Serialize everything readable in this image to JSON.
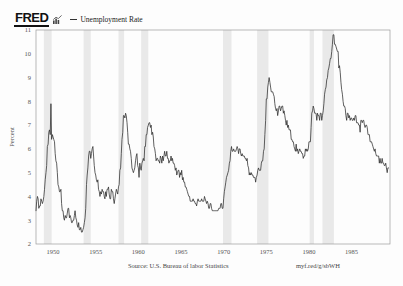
{
  "header": {
    "logo_text": "FRED",
    "logo_icon": "fred-bar-chart-icon",
    "legend_dash": "legend-line-dash",
    "series_label": "Unemployment Rate"
  },
  "footer": {
    "source": "Source: U.S. Bureau of labor Statistics",
    "url": "myf.red/g/sbWH"
  },
  "colors": {
    "line": "#2b2b2b",
    "recession_band": "#e9e9e9",
    "frame": "#9a9a9a",
    "text": "#555555",
    "background": "#fdfdfd"
  },
  "chart_data": {
    "type": "line",
    "title": "",
    "xlabel": "",
    "ylabel": "Percent",
    "ylim": [
      2,
      11
    ],
    "xlim": [
      1948.0,
      1989.5
    ],
    "yticks": [
      11,
      10,
      9,
      8,
      7,
      6,
      5,
      4,
      3,
      2
    ],
    "ytick_labels": [
      "11",
      "10",
      "9",
      "8",
      "7",
      "6",
      "5",
      "4",
      "3",
      "2"
    ],
    "xticks": [
      1950,
      1955,
      1960,
      1965,
      1970,
      1975,
      1980,
      1985
    ],
    "xtick_labels": [
      "1950",
      "1955",
      "1960",
      "1965",
      "1970",
      "1975",
      "1980",
      "1985"
    ],
    "grid": false,
    "legend_position": "top-left",
    "recession_bands": [
      [
        1948.92,
        1949.83
      ],
      [
        1953.58,
        1954.42
      ],
      [
        1957.67,
        1958.33
      ],
      [
        1960.33,
        1961.17
      ],
      [
        1969.92,
        1970.92
      ],
      [
        1973.92,
        1975.25
      ],
      [
        1980.08,
        1980.58
      ],
      [
        1981.58,
        1982.92
      ]
    ],
    "series": [
      {
        "name": "Unemployment Rate",
        "x": [
          1948.0,
          1948.08,
          1948.17,
          1948.25,
          1948.33,
          1948.42,
          1948.5,
          1948.58,
          1948.67,
          1948.75,
          1948.83,
          1948.92,
          1949.0,
          1949.08,
          1949.17,
          1949.25,
          1949.33,
          1949.42,
          1949.5,
          1949.58,
          1949.67,
          1949.75,
          1949.83,
          1949.92,
          1950.0,
          1950.08,
          1950.17,
          1950.25,
          1950.33,
          1950.42,
          1950.5,
          1950.58,
          1950.67,
          1950.75,
          1950.83,
          1950.92,
          1951.0,
          1951.08,
          1951.17,
          1951.25,
          1951.33,
          1951.42,
          1951.5,
          1951.58,
          1951.67,
          1951.75,
          1951.83,
          1951.92,
          1952.0,
          1952.08,
          1952.17,
          1952.25,
          1952.33,
          1952.42,
          1952.5,
          1952.58,
          1952.67,
          1952.75,
          1952.83,
          1952.92,
          1953.0,
          1953.08,
          1953.17,
          1953.25,
          1953.33,
          1953.42,
          1953.5,
          1953.58,
          1953.67,
          1953.75,
          1953.83,
          1953.92,
          1954.0,
          1954.08,
          1954.17,
          1954.25,
          1954.33,
          1954.42,
          1954.5,
          1954.58,
          1954.67,
          1954.75,
          1954.83,
          1954.92,
          1955.0,
          1955.08,
          1955.17,
          1955.25,
          1955.33,
          1955.42,
          1955.5,
          1955.58,
          1955.67,
          1955.75,
          1955.83,
          1955.92,
          1956.0,
          1956.08,
          1956.17,
          1956.25,
          1956.33,
          1956.42,
          1956.5,
          1956.58,
          1956.67,
          1956.75,
          1956.83,
          1956.92,
          1957.0,
          1957.08,
          1957.17,
          1957.25,
          1957.33,
          1957.42,
          1957.5,
          1957.58,
          1957.67,
          1957.75,
          1957.83,
          1957.92,
          1958.0,
          1958.08,
          1958.17,
          1958.25,
          1958.33,
          1958.42,
          1958.5,
          1958.58,
          1958.67,
          1958.75,
          1958.83,
          1958.92,
          1959.0,
          1959.08,
          1959.17,
          1959.25,
          1959.33,
          1959.42,
          1959.5,
          1959.58,
          1959.67,
          1959.75,
          1959.83,
          1959.92,
          1960.0,
          1960.08,
          1960.17,
          1960.25,
          1960.33,
          1960.42,
          1960.5,
          1960.58,
          1960.67,
          1960.75,
          1960.83,
          1960.92,
          1961.0,
          1961.08,
          1961.17,
          1961.25,
          1961.33,
          1961.42,
          1961.5,
          1961.58,
          1961.67,
          1961.75,
          1961.83,
          1961.92,
          1962.0,
          1962.08,
          1962.17,
          1962.25,
          1962.33,
          1962.42,
          1962.5,
          1962.58,
          1962.67,
          1962.75,
          1962.83,
          1962.92,
          1963.0,
          1963.08,
          1963.17,
          1963.25,
          1963.33,
          1963.42,
          1963.5,
          1963.58,
          1963.67,
          1963.75,
          1963.83,
          1963.92,
          1964.0,
          1964.08,
          1964.17,
          1964.25,
          1964.33,
          1964.42,
          1964.5,
          1964.58,
          1964.67,
          1964.75,
          1964.83,
          1964.92,
          1965.0,
          1965.08,
          1965.17,
          1965.25,
          1965.33,
          1965.42,
          1965.5,
          1965.58,
          1965.67,
          1965.75,
          1965.83,
          1965.92,
          1966.0,
          1966.08,
          1966.17,
          1966.25,
          1966.33,
          1966.42,
          1966.5,
          1966.58,
          1966.67,
          1966.75,
          1966.83,
          1966.92,
          1967.0,
          1967.08,
          1967.17,
          1967.25,
          1967.33,
          1967.42,
          1967.5,
          1967.58,
          1967.67,
          1967.75,
          1967.83,
          1967.92,
          1968.0,
          1968.08,
          1968.17,
          1968.25,
          1968.33,
          1968.42,
          1968.5,
          1968.58,
          1968.67,
          1968.75,
          1968.83,
          1968.92,
          1969.0,
          1969.08,
          1969.17,
          1969.25,
          1969.33,
          1969.42,
          1969.5,
          1969.58,
          1969.67,
          1969.75,
          1969.83,
          1969.92,
          1970.0,
          1970.08,
          1970.17,
          1970.25,
          1970.33,
          1970.42,
          1970.5,
          1970.58,
          1970.67,
          1970.75,
          1970.83,
          1970.92,
          1971.0,
          1971.08,
          1971.17,
          1971.25,
          1971.33,
          1971.42,
          1971.5,
          1971.58,
          1971.67,
          1971.75,
          1971.83,
          1971.92,
          1972.0,
          1972.08,
          1972.17,
          1972.25,
          1972.33,
          1972.42,
          1972.5,
          1972.58,
          1972.67,
          1972.75,
          1972.83,
          1972.92,
          1973.0,
          1973.08,
          1973.17,
          1973.25,
          1973.33,
          1973.42,
          1973.5,
          1973.58,
          1973.67,
          1973.75,
          1973.83,
          1973.92,
          1974.0,
          1974.08,
          1974.17,
          1974.25,
          1974.33,
          1974.42,
          1974.5,
          1974.58,
          1974.67,
          1974.75,
          1974.83,
          1974.92,
          1975.0,
          1975.08,
          1975.17,
          1975.25,
          1975.33,
          1975.42,
          1975.5,
          1975.58,
          1975.67,
          1975.75,
          1975.83,
          1975.92,
          1976.0,
          1976.08,
          1976.17,
          1976.25,
          1976.33,
          1976.42,
          1976.5,
          1976.58,
          1976.67,
          1976.75,
          1976.83,
          1976.92,
          1977.0,
          1977.08,
          1977.17,
          1977.25,
          1977.33,
          1977.42,
          1977.5,
          1977.58,
          1977.67,
          1977.75,
          1977.83,
          1977.92,
          1978.0,
          1978.08,
          1978.17,
          1978.25,
          1978.33,
          1978.42,
          1978.5,
          1978.58,
          1978.67,
          1978.75,
          1978.83,
          1978.92,
          1979.0,
          1979.08,
          1979.17,
          1979.25,
          1979.33,
          1979.42,
          1979.5,
          1979.58,
          1979.67,
          1979.75,
          1979.83,
          1979.92,
          1980.0,
          1980.08,
          1980.17,
          1980.25,
          1980.33,
          1980.42,
          1980.5,
          1980.58,
          1980.67,
          1980.75,
          1980.83,
          1980.92,
          1981.0,
          1981.08,
          1981.17,
          1981.25,
          1981.33,
          1981.42,
          1981.5,
          1981.58,
          1981.67,
          1981.75,
          1981.83,
          1981.92,
          1982.0,
          1982.08,
          1982.17,
          1982.25,
          1982.33,
          1982.42,
          1982.5,
          1982.58,
          1982.67,
          1982.75,
          1982.83,
          1982.92,
          1983.0,
          1983.08,
          1983.17,
          1983.25,
          1983.33,
          1983.42,
          1983.5,
          1983.58,
          1983.67,
          1983.75,
          1983.83,
          1983.92,
          1984.0,
          1984.08,
          1984.17,
          1984.25,
          1984.33,
          1984.42,
          1984.5,
          1984.58,
          1984.67,
          1984.75,
          1984.83,
          1984.92,
          1985.0,
          1985.08,
          1985.17,
          1985.25,
          1985.33,
          1985.42,
          1985.5,
          1985.58,
          1985.67,
          1985.75,
          1985.83,
          1985.92,
          1986.0,
          1986.08,
          1986.17,
          1986.25,
          1986.33,
          1986.42,
          1986.5,
          1986.58,
          1986.67,
          1986.75,
          1986.83,
          1986.92,
          1987.0,
          1987.08,
          1987.17,
          1987.25,
          1987.33,
          1987.42,
          1987.5,
          1987.58,
          1987.67,
          1987.75,
          1987.83,
          1987.92,
          1988.0,
          1988.08,
          1988.17,
          1988.25,
          1988.33,
          1988.42,
          1988.5,
          1988.58,
          1988.67,
          1988.75,
          1988.83,
          1988.92,
          1989.0,
          1989.08,
          1989.17,
          1989.25,
          1989.33
        ],
        "values": [
          3.4,
          3.8,
          4.0,
          3.9,
          3.5,
          3.6,
          3.6,
          3.9,
          3.8,
          3.7,
          3.8,
          4.0,
          4.3,
          4.7,
          5.0,
          5.3,
          6.1,
          6.2,
          6.7,
          6.8,
          6.6,
          7.9,
          6.4,
          6.6,
          6.5,
          6.4,
          6.3,
          5.8,
          5.5,
          5.4,
          5.0,
          4.5,
          4.4,
          4.2,
          4.2,
          4.3,
          3.7,
          3.4,
          3.4,
          3.1,
          3.0,
          3.2,
          3.1,
          3.1,
          3.3,
          3.5,
          3.5,
          3.1,
          3.2,
          3.1,
          2.9,
          2.9,
          3.0,
          3.0,
          3.2,
          3.4,
          3.1,
          3.0,
          2.8,
          2.7,
          2.9,
          2.6,
          2.6,
          2.7,
          2.5,
          2.5,
          2.6,
          2.7,
          2.9,
          3.1,
          3.5,
          4.5,
          4.9,
          5.2,
          5.7,
          5.9,
          5.9,
          5.6,
          5.8,
          6.0,
          6.1,
          5.7,
          5.3,
          5.0,
          4.9,
          4.7,
          4.6,
          4.7,
          4.3,
          4.2,
          4.0,
          4.2,
          4.1,
          4.3,
          4.2,
          4.2,
          4.0,
          3.9,
          4.2,
          4.0,
          4.3,
          4.3,
          4.4,
          4.1,
          3.9,
          3.9,
          4.3,
          4.2,
          4.2,
          3.9,
          3.7,
          3.9,
          4.1,
          4.3,
          4.2,
          4.1,
          4.4,
          4.5,
          5.1,
          5.2,
          5.8,
          6.4,
          6.7,
          7.4,
          7.4,
          7.3,
          7.5,
          7.4,
          7.1,
          6.7,
          6.2,
          6.2,
          6.0,
          5.9,
          5.6,
          5.2,
          5.1,
          5.0,
          5.1,
          5.2,
          5.5,
          5.7,
          5.8,
          5.3,
          5.2,
          4.8,
          5.4,
          5.2,
          5.1,
          5.4,
          5.5,
          5.6,
          5.5,
          6.1,
          6.1,
          6.6,
          6.6,
          6.9,
          7.0,
          7.1,
          7.1,
          6.9,
          7.0,
          6.6,
          6.7,
          6.5,
          6.1,
          6.0,
          5.8,
          5.5,
          5.6,
          5.6,
          5.5,
          5.5,
          5.4,
          5.7,
          5.6,
          5.4,
          5.7,
          5.5,
          5.7,
          5.9,
          5.7,
          5.7,
          5.9,
          5.6,
          5.6,
          5.4,
          5.5,
          5.5,
          5.7,
          5.5,
          5.6,
          5.4,
          5.4,
          5.3,
          5.1,
          5.2,
          4.9,
          5.0,
          5.1,
          5.1,
          4.8,
          5.0,
          4.9,
          5.1,
          4.7,
          4.8,
          4.6,
          4.6,
          4.4,
          4.4,
          4.3,
          4.2,
          4.1,
          4.0,
          4.0,
          3.8,
          3.8,
          3.8,
          3.8,
          3.9,
          3.8,
          3.8,
          3.7,
          3.7,
          3.6,
          3.8,
          3.9,
          3.8,
          3.8,
          3.8,
          3.8,
          3.9,
          3.8,
          3.8,
          3.8,
          4.0,
          3.9,
          3.8,
          3.7,
          3.8,
          3.7,
          3.5,
          3.5,
          3.7,
          3.7,
          3.5,
          3.4,
          3.4,
          3.4,
          3.4,
          3.4,
          3.4,
          3.4,
          3.4,
          3.4,
          3.5,
          3.5,
          3.5,
          3.7,
          3.7,
          3.5,
          3.5,
          3.9,
          4.2,
          4.4,
          4.6,
          4.8,
          4.9,
          5.0,
          5.1,
          5.4,
          5.5,
          5.9,
          6.1,
          5.9,
          5.9,
          6.0,
          5.9,
          5.9,
          5.9,
          6.0,
          6.1,
          6.0,
          5.8,
          6.0,
          6.0,
          5.8,
          5.7,
          5.8,
          5.7,
          5.7,
          5.7,
          5.6,
          5.6,
          5.5,
          5.6,
          5.3,
          5.2,
          4.9,
          5.0,
          4.9,
          5.0,
          4.9,
          4.9,
          4.8,
          4.8,
          4.8,
          4.6,
          4.8,
          4.9,
          5.1,
          5.2,
          5.1,
          5.1,
          5.1,
          5.4,
          5.5,
          5.5,
          5.9,
          6.0,
          6.6,
          7.2,
          8.1,
          8.1,
          8.6,
          8.8,
          9.0,
          8.8,
          8.6,
          8.4,
          8.4,
          8.4,
          8.3,
          8.2,
          7.9,
          7.7,
          7.6,
          7.7,
          7.4,
          7.6,
          7.8,
          7.8,
          7.6,
          7.7,
          7.8,
          7.8,
          7.5,
          7.6,
          7.4,
          7.2,
          7.0,
          7.2,
          6.9,
          7.0,
          6.8,
          6.8,
          6.8,
          6.4,
          6.4,
          6.3,
          6.3,
          6.1,
          6.0,
          5.9,
          6.2,
          5.9,
          6.0,
          5.8,
          5.9,
          6.0,
          5.9,
          5.9,
          5.8,
          5.8,
          5.6,
          5.7,
          5.7,
          6.0,
          5.9,
          6.0,
          5.9,
          6.0,
          6.3,
          6.3,
          6.3,
          6.9,
          7.5,
          7.6,
          7.8,
          7.7,
          7.5,
          7.5,
          7.5,
          7.2,
          7.5,
          7.4,
          7.4,
          7.2,
          7.5,
          7.5,
          7.2,
          7.4,
          7.6,
          7.9,
          8.3,
          8.5,
          8.6,
          8.9,
          9.0,
          9.3,
          9.4,
          9.6,
          9.8,
          9.8,
          10.1,
          10.4,
          10.8,
          10.8,
          10.4,
          10.4,
          10.3,
          10.2,
          10.1,
          10.1,
          9.4,
          9.5,
          9.2,
          8.8,
          8.5,
          8.3,
          8.0,
          7.8,
          7.8,
          7.7,
          7.4,
          7.2,
          7.5,
          7.5,
          7.3,
          7.4,
          7.2,
          7.3,
          7.3,
          7.2,
          7.2,
          7.3,
          7.2,
          7.4,
          7.4,
          7.1,
          7.1,
          7.1,
          7.0,
          7.0,
          6.7,
          7.2,
          7.2,
          7.1,
          7.2,
          7.2,
          7.0,
          6.9,
          7.0,
          7.0,
          6.9,
          6.6,
          6.6,
          6.6,
          6.3,
          6.3,
          6.3,
          6.2,
          6.1,
          6.0,
          5.9,
          6.0,
          5.8,
          5.7,
          5.7,
          5.7,
          5.7,
          5.4,
          5.6,
          5.4,
          5.4,
          5.6,
          5.4,
          5.4,
          5.3,
          5.3,
          5.4,
          5.2,
          5.0,
          5.2,
          5.2
        ]
      }
    ]
  }
}
